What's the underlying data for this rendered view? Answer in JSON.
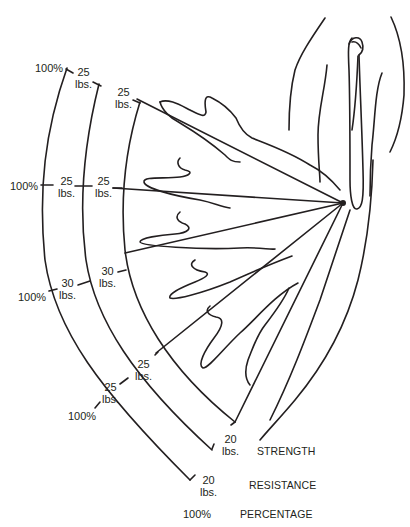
{
  "diagram": {
    "legend": {
      "strength": "STRENGTH",
      "resistance": "RESISTANCE",
      "percentage": "PERCENTAGE"
    },
    "percentage_labels": [
      "100%",
      "100%",
      "100%",
      "100%",
      "100%"
    ],
    "resistance_labels": [
      {
        "value": "25",
        "unit": "lbs."
      },
      {
        "value": "25",
        "unit": "lbs."
      },
      {
        "value": "30",
        "unit": "lbs."
      },
      {
        "value": "25",
        "unit": "lbs."
      },
      {
        "value": "20",
        "unit": "lbs."
      }
    ],
    "strength_labels": [
      {
        "value": "25",
        "unit": "lbs."
      },
      {
        "value": "25",
        "unit": "lbs."
      },
      {
        "value": "30",
        "unit": "lbs."
      },
      {
        "value": "25",
        "unit": "lbs."
      },
      {
        "value": "20",
        "unit": "lbs."
      }
    ],
    "colors": {
      "line": "#231f20",
      "background": "#ffffff"
    }
  }
}
